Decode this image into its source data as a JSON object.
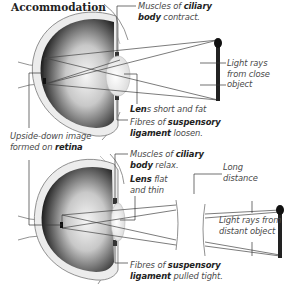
{
  "title": "Accommodation",
  "top_panel": {
    "name": "close object",
    "labels": {
      "ciliary_pre": "Muscles of ",
      "ciliary_bold": "ciliary",
      "ciliary_bold2": "body",
      "ciliary_post": " contract.",
      "lens_bold": "Len",
      "lens_post": "s short and fat",
      "fibres_pre": "Fibres of ",
      "fibres_bold": "suspensory",
      "fibres_bold2": "ligament",
      "fibres_post": " loosen.",
      "rays_line1": "Light rays",
      "rays_line2": "from close",
      "rays_line3": "object"
    }
  },
  "middle_label": {
    "line1": "Upside-down image",
    "line2_pre": "formed on ",
    "line2_bold": "retina"
  },
  "bottom_panel": {
    "name": "distant object",
    "labels": {
      "ciliary_pre": "Muscles of ",
      "ciliary_bold": "ciliary",
      "ciliary_bold2": "body",
      "ciliary_post": " relax.",
      "lens_bold": "Lens",
      "lens_post": " flat",
      "lens_line2": "and thin",
      "long_line1": "Long",
      "long_line2": "distance",
      "rays_line1": "Light rays from",
      "rays_line2": "distant object",
      "fibres_pre": "Fibres of ",
      "fibres_bold": "suspensory",
      "fibres_bold2": "ligament",
      "fibres_post": " pulled tight."
    }
  },
  "colors": {
    "eye_outer": "#e9e9e9",
    "eye_inner_dark": "#2b2b2b",
    "eye_inner_light": "#f2f2f2",
    "ray": "#444444",
    "candle": "#222222"
  }
}
